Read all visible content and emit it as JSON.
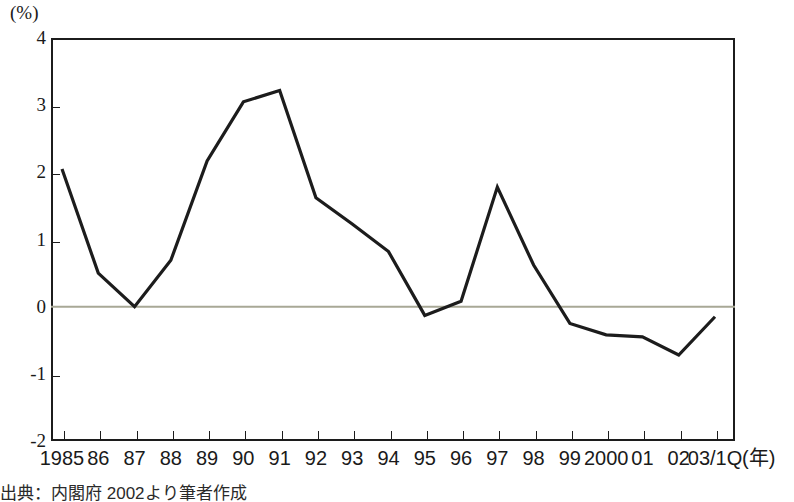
{
  "chart_data": {
    "type": "line",
    "title": "",
    "subtitle": "",
    "xlabel": "(年)",
    "ylabel": "(%)",
    "ylim": [
      -2,
      4
    ],
    "yticks": [
      4,
      3,
      2,
      1,
      0,
      -1,
      -2
    ],
    "ytick_labels": [
      "4",
      "3",
      "2",
      "1",
      "0",
      "-1",
      "-2"
    ],
    "grid": false,
    "zero_line": true,
    "legend": "none",
    "categories": [
      "1985",
      "86",
      "87",
      "88",
      "89",
      "90",
      "91",
      "92",
      "93",
      "94",
      "95",
      "96",
      "97",
      "98",
      "99",
      "2000",
      "01",
      "02",
      "03/1Q"
    ],
    "values": [
      2.05,
      0.5,
      0.0,
      0.69,
      2.17,
      3.05,
      3.22,
      1.62,
      1.23,
      0.82,
      -0.13,
      0.08,
      1.78,
      0.62,
      -0.25,
      -0.42,
      -0.45,
      -0.72,
      -0.15
    ],
    "series": [
      {
        "name": "",
        "values": [
          2.05,
          0.5,
          0.0,
          0.69,
          2.17,
          3.05,
          3.22,
          1.62,
          1.23,
          0.82,
          -0.13,
          0.08,
          1.78,
          0.62,
          -0.25,
          -0.42,
          -0.45,
          -0.72,
          -0.15
        ]
      }
    ],
    "line_color": "#1c1c1c",
    "axis_color": "#1c1c1c",
    "zero_line_color": "#a8a896",
    "background_color": "#ffffff"
  },
  "axis": {
    "y_unit": "(%)",
    "x_unit": "(年)"
  },
  "footer": {
    "source_note": "出典：内閣府 2002より筆者作成"
  }
}
